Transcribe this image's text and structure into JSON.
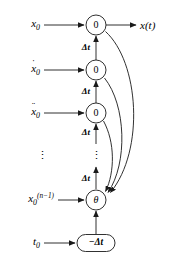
{
  "figure": {
    "type": "signal-flow-diagram",
    "background_color": "#ffffff",
    "stroke_color": "#1a1a1a",
    "width": 171,
    "height": 263
  },
  "inputs": [
    {
      "id": "x0",
      "base": "x",
      "subscript": "0",
      "accent": "",
      "superscript": "",
      "label": "x0",
      "y": 25
    },
    {
      "id": "xdot0",
      "base": "x",
      "subscript": "0",
      "accent": "˙",
      "superscript": "",
      "label": "ẋ0",
      "y": 70
    },
    {
      "id": "xddot0",
      "base": "x",
      "subscript": "0",
      "accent": "¨",
      "superscript": "",
      "label": "ẍ0",
      "y": 113
    },
    {
      "id": "xn1_0",
      "base": "x",
      "subscript": "0",
      "accent": "",
      "superscript": "(n−1)",
      "label": "x0^(n-1)",
      "y": 200
    },
    {
      "id": "t0",
      "base": "t",
      "subscript": "0",
      "accent": "",
      "superscript": "",
      "label": "t0",
      "y": 243
    }
  ],
  "input_ellipsis": "⋮",
  "nodes": [
    {
      "id": "node-0-a",
      "shape": "circle",
      "label": "0",
      "cx": 96,
      "cy": 25,
      "r": 10
    },
    {
      "id": "node-0-b",
      "shape": "circle",
      "label": "0",
      "cx": 96,
      "cy": 70,
      "r": 10
    },
    {
      "id": "node-0-c",
      "shape": "circle",
      "label": "0",
      "cx": 96,
      "cy": 113,
      "r": 10
    },
    {
      "id": "node-theta",
      "shape": "circle",
      "label": "θ",
      "cx": 96,
      "cy": 200,
      "r": 10
    },
    {
      "id": "node-mdt",
      "shape": "rounded-rect",
      "label": "−Δt",
      "cx": 96,
      "cy": 243,
      "w": 38,
      "h": 17
    }
  ],
  "edge_labels": [
    {
      "id": "dt-1",
      "text": "Δt",
      "x": 90,
      "y": 47
    },
    {
      "id": "dt-2",
      "text": "Δt",
      "x": 90,
      "y": 91
    },
    {
      "id": "dt-3",
      "text": "Δt",
      "x": 90,
      "y": 132
    },
    {
      "id": "dt-4",
      "text": "Δt",
      "x": 90,
      "y": 178
    }
  ],
  "chain_ellipsis": "⋮",
  "output": {
    "id": "x-of-t",
    "label": "x(t)",
    "x": 141,
    "y": 25
  },
  "feedback_paths": [
    {
      "id": "feedback-from-node-0-a",
      "from": "node-0-a",
      "to": "node-theta"
    },
    {
      "id": "feedback-from-node-0-b",
      "from": "node-0-b",
      "to": "node-theta"
    },
    {
      "id": "feedback-from-node-0-c",
      "from": "node-0-c",
      "to": "node-theta"
    }
  ]
}
